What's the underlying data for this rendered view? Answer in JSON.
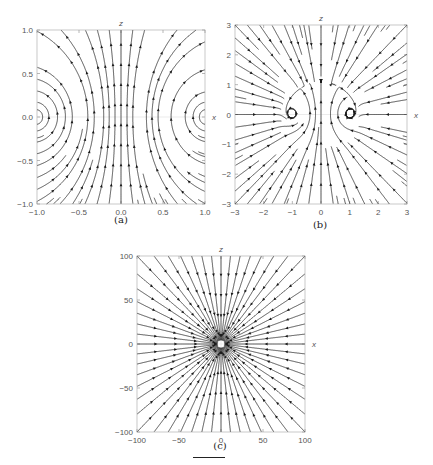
{
  "figure": {
    "captions": [
      "(a)",
      "(b)",
      "(c)"
    ]
  },
  "chart_data": [
    {
      "type": "streamplot",
      "panel": "(a)",
      "xlabel": "x",
      "ylabel": "z",
      "xlim": [
        -1.0,
        1.0
      ],
      "ylim": [
        -1.0,
        1.0
      ],
      "xticks": [
        "-1.0",
        "-0.5",
        "0.0",
        "0.5",
        "1.0"
      ],
      "yticks": [
        "-1.0",
        "-0.5",
        "0.0",
        "0.5",
        "1.0"
      ],
      "xtick_values": [
        -1.0,
        -0.5,
        0.0,
        0.5,
        1.0
      ],
      "ytick_values": [
        -1.0,
        -0.5,
        0.0,
        0.5,
        1.0
      ],
      "field": "two counter-rotating vortices centred at (±1, 0); upward flow along z-axis, returning down the sides",
      "grid": false,
      "frame": {
        "left": 37,
        "top": 30,
        "width": 168,
        "height": 174
      }
    },
    {
      "type": "streamplot",
      "panel": "(b)",
      "xlabel": "x",
      "ylabel": "z",
      "xlim": [
        -3,
        3
      ],
      "ylim": [
        -3,
        3
      ],
      "xticks": [
        "-3",
        "-2",
        "-1",
        "0",
        "1",
        "2",
        "3"
      ],
      "yticks": [
        "-3",
        "-2",
        "-1",
        "0",
        "1",
        "2",
        "3"
      ],
      "xtick_values": [
        -3,
        -2,
        -1,
        0,
        1,
        2,
        3
      ],
      "ytick_values": [
        -3,
        -2,
        -1,
        0,
        1,
        2,
        3
      ],
      "field": "near-field vortex loops around (±1, 0) embedded in an inward-converging far field",
      "grid": false,
      "frame": {
        "left": 235,
        "top": 25,
        "width": 172,
        "height": 179
      }
    },
    {
      "type": "streamplot",
      "panel": "(c)",
      "xlabel": "x",
      "ylabel": "z",
      "xlim": [
        -100,
        100
      ],
      "ylim": [
        -100,
        100
      ],
      "xticks": [
        "-100",
        "-50",
        "0",
        "50",
        "100"
      ],
      "yticks": [
        "-100",
        "-50",
        "0",
        "50",
        "100"
      ],
      "xtick_values": [
        -100,
        -50,
        0,
        50,
        100
      ],
      "ytick_values": [
        -100,
        -50,
        0,
        50,
        100
      ],
      "field": "radial streamlines converging on the origin",
      "grid": false,
      "frame": {
        "left": 137,
        "top": 256,
        "width": 168,
        "height": 176
      }
    }
  ]
}
